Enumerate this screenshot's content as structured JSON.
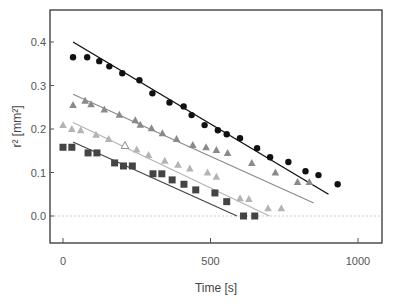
{
  "chart_data": {
    "type": "scatter",
    "title": "",
    "xlabel": "Time [s]",
    "ylabel": "r² [mm²]",
    "xlim": [
      -100,
      1080
    ],
    "ylim": [
      -0.06,
      0.47
    ],
    "xticks": [
      0,
      500,
      1000
    ],
    "xtick_labels": [
      "0",
      "500",
      "1000"
    ],
    "yticks": [
      0.0,
      0.1,
      0.2,
      0.3,
      0.4
    ],
    "ytick_labels": [
      "0.0",
      "0.1",
      "0.2",
      "0.3",
      "0.4"
    ],
    "grid": false,
    "reference_line": {
      "y": 0.0,
      "style": "dotted",
      "color": "#cccccc"
    },
    "legend": null,
    "series": [
      {
        "name": "black circles",
        "marker": "circle",
        "color": "#111111",
        "x": [
          34,
          82,
          123,
          157,
          201,
          259,
          303,
          361,
          409,
          436,
          480,
          525,
          555,
          600,
          658,
          702,
          764,
          822,
          866,
          931
        ],
        "y": [
          0.365,
          0.365,
          0.356,
          0.344,
          0.328,
          0.312,
          0.282,
          0.261,
          0.252,
          0.232,
          0.209,
          0.197,
          0.188,
          0.179,
          0.156,
          0.135,
          0.124,
          0.103,
          0.094,
          0.073
        ],
        "fit": {
          "x": [
            34,
            900
          ],
          "y": [
            0.4,
            0.05
          ]
        }
      },
      {
        "name": "dark gray triangles",
        "marker": "triangle",
        "color": "#8a8a8a",
        "x": [
          34,
          75,
          95,
          140,
          191,
          245,
          262,
          300,
          337,
          385,
          440,
          485,
          520,
          558,
          640,
          720,
          795,
          835
        ],
        "y": [
          0.255,
          0.265,
          0.257,
          0.245,
          0.233,
          0.22,
          0.21,
          0.202,
          0.19,
          0.177,
          0.163,
          0.158,
          0.152,
          0.145,
          0.122,
          0.1,
          0.078,
          0.078
        ],
        "fit": {
          "x": [
            34,
            850
          ],
          "y": [
            0.28,
            0.03
          ]
        }
      },
      {
        "name": "light gray triangles",
        "marker": "triangle",
        "color": "#b4b4b4",
        "x": [
          0,
          30,
          60,
          112,
          155,
          211,
          250,
          290,
          345,
          390,
          430,
          490,
          520,
          600,
          630,
          695,
          740
        ],
        "y": [
          0.209,
          0.2,
          0.197,
          0.187,
          0.177,
          0.162,
          0.153,
          0.14,
          0.127,
          0.118,
          0.109,
          0.1,
          0.09,
          0.041,
          0.039,
          0.018,
          0.018
        ],
        "fit": {
          "x": [
            34,
            700
          ],
          "y": [
            0.215,
            0.0
          ]
        },
        "open_marker": {
          "x": 210,
          "y": 0.162
        }
      },
      {
        "name": "dark squares",
        "marker": "square",
        "color": "#444444",
        "x": [
          0,
          30,
          85,
          115,
          175,
          205,
          235,
          305,
          335,
          370,
          410,
          450,
          515,
          555,
          612,
          650
        ],
        "y": [
          0.158,
          0.158,
          0.145,
          0.145,
          0.122,
          0.115,
          0.115,
          0.097,
          0.097,
          0.083,
          0.073,
          0.06,
          0.053,
          0.033,
          0.0,
          0.0
        ],
        "fit": {
          "x": [
            34,
            590
          ],
          "y": [
            0.17,
            0.0
          ]
        }
      }
    ]
  }
}
